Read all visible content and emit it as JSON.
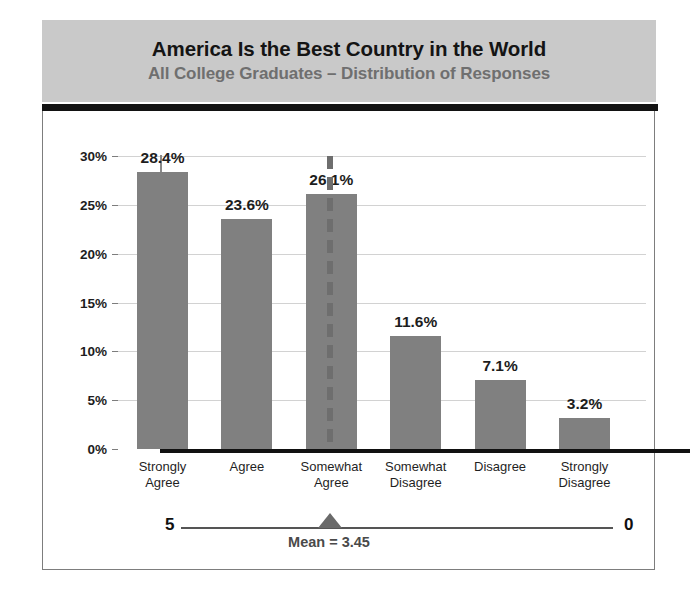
{
  "header": {
    "title": "America Is the Best Country in the World",
    "subtitle": "All College Graduates – Distribution of Responses"
  },
  "axis": {
    "yticks": [
      "30%",
      "25%",
      "20%",
      "15%",
      "10%",
      "5%",
      "0%"
    ]
  },
  "scale": {
    "left_end": "5",
    "right_end": "0",
    "mean_label": "Mean = 3.45"
  },
  "colors": {
    "bar_fill": "#808080",
    "header_band": "#c9c9c9",
    "header_rule": "#121212",
    "title_text": "#141414",
    "subtitle_text": "#6f6f6f",
    "gridline": "#d2d2d2",
    "mean_dash": "#6e6e6e",
    "axis_line": "#111111"
  },
  "chart_data": {
    "type": "bar",
    "title": "America Is the Best Country in the World",
    "subtitle": "All College Graduates – Distribution of Responses",
    "xlabel": "",
    "ylabel": "",
    "ylim": [
      0,
      30
    ],
    "ytick_values": [
      0,
      5,
      10,
      15,
      20,
      25,
      30
    ],
    "grid": true,
    "legend": false,
    "categories": [
      "Strongly Agree",
      "Agree",
      "Somewhat Agree",
      "Somewhat Disagree",
      "Disagree",
      "Strongly Disagree"
    ],
    "category_lines": [
      [
        "Strongly",
        "Agree"
      ],
      [
        "Agree",
        ""
      ],
      [
        "Somewhat",
        "Agree"
      ],
      [
        "Somewhat",
        "Disagree"
      ],
      [
        "Disagree",
        ""
      ],
      [
        "Strongly",
        "Disagree"
      ]
    ],
    "values": [
      28.4,
      23.6,
      26.1,
      11.6,
      7.1,
      3.2
    ],
    "value_labels": [
      "28.4%",
      "23.6%",
      "26.1%",
      "11.6%",
      "7.1%",
      "3.2%"
    ],
    "annotations": {
      "mean": 3.45,
      "mean_label": "Mean = 3.45",
      "scale_left": "5",
      "scale_right": "0",
      "divider_line": "dashed vertical line between Agree and Somewhat Agree"
    }
  }
}
